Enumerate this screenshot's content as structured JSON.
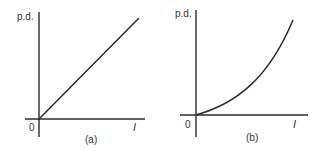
{
  "figure": {
    "colors": {
      "ink": "#2a2a2a",
      "text": "#333333",
      "background": "#ffffff"
    },
    "graphs": [
      {
        "id": "a",
        "caption": "(a)",
        "y_axis_label": "p.d.",
        "x_axis_label": "I",
        "origin_label": "0",
        "relationship": "linear (straight line through origin)"
      },
      {
        "id": "b",
        "caption": "(b)",
        "y_axis_label": "p.d.",
        "x_axis_label": "I",
        "origin_label": "0",
        "relationship": "non-linear (curve increasing in gradient, through origin)"
      }
    ]
  }
}
